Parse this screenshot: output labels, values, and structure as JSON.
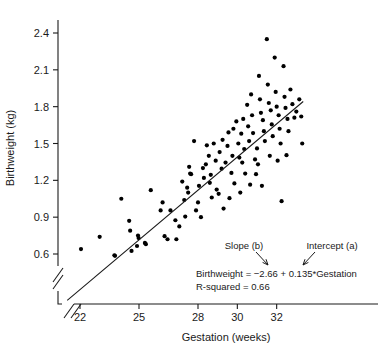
{
  "chart_data": {
    "type": "scatter",
    "title": "",
    "xlabel": "Gestation (weeks)",
    "ylabel": "Birthweight (kg)",
    "xlim": [
      21.0,
      33.6
    ],
    "ylim": [
      0.42,
      2.52
    ],
    "xticks": [
      22,
      25,
      28,
      30,
      32
    ],
    "yticks": [
      0.6,
      0.9,
      1.2,
      1.5,
      1.8,
      2.1,
      2.4
    ],
    "xtick_labels": [
      "22",
      "25",
      "28",
      "30",
      "32"
    ],
    "ytick_labels": [
      "0.6",
      "0.9",
      "1.2",
      "1.5",
      "1.8",
      "2.1",
      "2.4"
    ],
    "grid": false,
    "legend": "none",
    "axis_break_x": true,
    "axis_break_y": true,
    "fit_line": {
      "type": "linear-regression",
      "slope": 0.135,
      "intercept": -2.66,
      "r_squared": 0.66,
      "x_start": 21.35,
      "x_end": 33.35
    },
    "annotations": {
      "slope_label": "Slope (b)",
      "intercept_label": "Intercept (a)",
      "equation": "Birthweight  =  −2.66 + 0.135*Gestation",
      "r_squared_text": "R-squared = 0.66"
    },
    "points": [
      [
        22.05,
        0.64
      ],
      [
        23.0,
        0.74
      ],
      [
        23.75,
        0.59
      ],
      [
        23.78,
        0.585
      ],
      [
        24.5,
        0.87
      ],
      [
        24.55,
        0.79
      ],
      [
        24.95,
        0.75
      ],
      [
        24.98,
        0.73
      ],
      [
        24.9,
        0.665
      ],
      [
        24.62,
        0.625
      ],
      [
        25.3,
        0.69
      ],
      [
        25.35,
        0.68
      ],
      [
        26.1,
        0.955
      ],
      [
        26.3,
        0.745
      ],
      [
        26.6,
        0.955
      ],
      [
        26.45,
        0.72
      ],
      [
        26.85,
        0.875
      ],
      [
        27.05,
        0.825
      ],
      [
        26.9,
        0.72
      ],
      [
        24.1,
        1.05
      ],
      [
        25.6,
        1.12
      ],
      [
        26.2,
        1.02
      ],
      [
        27.2,
        1.19
      ],
      [
        27.3,
        1.04
      ],
      [
        27.45,
        1.14
      ],
      [
        27.5,
        1.1
      ],
      [
        27.6,
        1.255
      ],
      [
        27.65,
        1.25
      ],
      [
        27.55,
        1.31
      ],
      [
        27.9,
        0.955
      ],
      [
        28.0,
        1.02
      ],
      [
        28.05,
        1.155
      ],
      [
        28.25,
        1.3
      ],
      [
        28.3,
        1.22
      ],
      [
        28.4,
        1.33
      ],
      [
        28.55,
        1.4
      ],
      [
        28.6,
        1.18
      ],
      [
        28.65,
        1.245
      ],
      [
        28.8,
        1.5
      ],
      [
        28.9,
        1.36
      ],
      [
        28.95,
        1.125
      ],
      [
        29.1,
        1.43
      ],
      [
        29.2,
        1.295
      ],
      [
        29.25,
        1.53
      ],
      [
        29.4,
        1.345
      ],
      [
        29.5,
        1.48
      ],
      [
        29.55,
        1.59
      ],
      [
        29.7,
        1.26
      ],
      [
        29.75,
        1.4
      ],
      [
        29.8,
        1.62
      ],
      [
        29.95,
        1.68
      ],
      [
        30.05,
        1.5
      ],
      [
        30.1,
        1.385
      ],
      [
        30.2,
        1.58
      ],
      [
        30.3,
        1.7
      ],
      [
        30.35,
        1.455
      ],
      [
        30.5,
        1.815
      ],
      [
        30.55,
        1.64
      ],
      [
        30.6,
        1.52
      ],
      [
        30.7,
        1.9
      ],
      [
        30.75,
        1.73
      ],
      [
        30.8,
        1.585
      ],
      [
        30.9,
        1.37
      ],
      [
        30.95,
        1.25
      ],
      [
        31.0,
        1.46
      ],
      [
        31.1,
        2.05
      ],
      [
        31.15,
        1.86
      ],
      [
        31.2,
        1.75
      ],
      [
        31.3,
        1.69
      ],
      [
        31.35,
        1.6
      ],
      [
        31.4,
        1.52
      ],
      [
        31.5,
        2.35
      ],
      [
        31.55,
        1.98
      ],
      [
        31.6,
        1.83
      ],
      [
        31.7,
        1.77
      ],
      [
        31.75,
        1.655
      ],
      [
        31.8,
        1.56
      ],
      [
        31.9,
        2.2
      ],
      [
        31.95,
        1.92
      ],
      [
        32.0,
        1.8
      ],
      [
        32.1,
        1.73
      ],
      [
        32.15,
        1.62
      ],
      [
        32.2,
        1.5
      ],
      [
        32.35,
        2.13
      ],
      [
        32.4,
        1.88
      ],
      [
        32.45,
        1.79
      ],
      [
        32.55,
        1.7
      ],
      [
        32.6,
        1.6
      ],
      [
        32.7,
        1.94
      ],
      [
        32.8,
        1.82
      ],
      [
        32.9,
        1.71
      ],
      [
        33.0,
        1.76
      ],
      [
        33.15,
        1.86
      ],
      [
        33.25,
        1.72
      ],
      [
        30.15,
        1.1
      ],
      [
        31.25,
        1.155
      ],
      [
        32.25,
        1.03
      ],
      [
        28.15,
        0.9
      ],
      [
        29.3,
        0.97
      ],
      [
        27.8,
        1.52
      ],
      [
        30.4,
        1.255
      ],
      [
        31.05,
        1.33
      ],
      [
        29.85,
        1.175
      ],
      [
        28.7,
        1.06
      ],
      [
        32.5,
        1.405
      ],
      [
        33.3,
        1.5
      ],
      [
        29.05,
        1.09
      ],
      [
        30.65,
        1.165
      ],
      [
        31.65,
        1.4
      ],
      [
        28.45,
        1.485
      ],
      [
        29.6,
        1.055
      ],
      [
        30.25,
        1.345
      ],
      [
        27.35,
        0.905
      ],
      [
        32.05,
        1.36
      ]
    ]
  }
}
